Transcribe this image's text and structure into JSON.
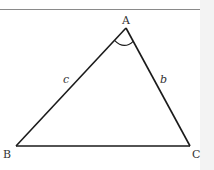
{
  "figure": {
    "type": "triangle",
    "vertices": {
      "A": {
        "label": "A",
        "x": 126,
        "y": 28
      },
      "B": {
        "label": "B",
        "x": 16,
        "y": 146
      },
      "C": {
        "label": "C",
        "x": 190,
        "y": 146
      }
    },
    "sides": {
      "b": {
        "label": "b",
        "between": [
          "A",
          "C"
        ]
      },
      "c": {
        "label": "c",
        "between": [
          "A",
          "B"
        ]
      }
    },
    "angle_mark": {
      "vertex": "A"
    },
    "colors": {
      "stroke": "#1a1a1a",
      "text": "#333333",
      "rule": "#8a8a8a"
    }
  }
}
